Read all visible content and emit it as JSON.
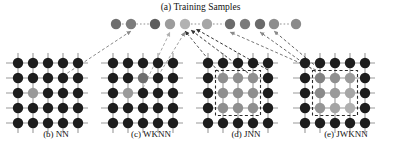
{
  "figure": {
    "title": "(a) Training Samples",
    "width": 401,
    "height": 148,
    "background": "#ffffff"
  },
  "colors": {
    "node_dark": "#1d1d1d",
    "node_gray_mid": "#8c8c8c",
    "node_gray_light": "#b4b4b4",
    "node_gray_lighter": "#c8c8c8",
    "grid_line": "#9a9a9a",
    "arrow_dark": "#222222",
    "arrow_gray": "#8a8a8a",
    "arrow_light": "#b0b0b0",
    "dashed_box": "#2a2a2a",
    "text": "#111111"
  },
  "training_samples": {
    "label": "(a) Training Samples",
    "row_y": 24,
    "radius": 5.2,
    "count": 11,
    "nodes": [
      {
        "index": 0,
        "x": 116,
        "y": 24,
        "shade": "#6f6f6f"
      },
      {
        "index": 1,
        "x": 131,
        "y": 24,
        "shade": "#7c7c7c"
      },
      {
        "index": 2,
        "x": 155,
        "y": 24,
        "shade": "#5e5e5e"
      },
      {
        "index": 3,
        "x": 170,
        "y": 24,
        "shade": "#9c9c9c"
      },
      {
        "index": 4,
        "x": 185,
        "y": 24,
        "shade": "#b2b2b2"
      },
      {
        "index": 5,
        "x": 207,
        "y": 24,
        "shade": "#a6a6a6"
      },
      {
        "index": 6,
        "x": 230,
        "y": 24,
        "shade": "#6b6b6b"
      },
      {
        "index": 7,
        "x": 245,
        "y": 24,
        "shade": "#7a7a7a"
      },
      {
        "index": 8,
        "x": 260,
        "y": 24,
        "shade": "#6a6a6a"
      },
      {
        "index": 9,
        "x": 274,
        "y": 24,
        "shade": "#8d8d8d"
      },
      {
        "index": 10,
        "x": 296,
        "y": 24,
        "shade": "#8a8a8a"
      }
    ]
  },
  "panels": [
    {
      "id": "nn",
      "label": "(b) NN",
      "caption_x": 10,
      "caption_width": 92,
      "origin_x": 18,
      "origin_y": 63,
      "cols": 5,
      "rows": 5,
      "spacing": 15,
      "radius": 5.2,
      "highlight": {
        "row": 2,
        "col": 1,
        "shade": "#9a9a9a"
      },
      "box": null,
      "description": "single nearest neighbour highlighted"
    },
    {
      "id": "wknn",
      "label": "(c) WKNN",
      "caption_x": 105,
      "caption_width": 92,
      "origin_x": 113,
      "origin_y": 63,
      "cols": 5,
      "rows": 5,
      "spacing": 15,
      "radius": 5.2,
      "highlight": {
        "row": 2,
        "col": 1,
        "shade": "#9a9a9a"
      },
      "secondary": {
        "row": 1,
        "col": 2,
        "shade": "#6e6e6e"
      },
      "box": null,
      "description": "weighted k nearest neighbours highlighted"
    },
    {
      "id": "jnn",
      "label": "(d) JNN",
      "caption_x": 200,
      "caption_width": 92,
      "origin_x": 208,
      "origin_y": 63,
      "cols": 5,
      "rows": 5,
      "spacing": 15,
      "radius": 5.2,
      "block": {
        "row_start": 1,
        "row_end": 3,
        "col_start": 1,
        "col_end": 3,
        "shade": "#8f8f8f"
      },
      "box": {
        "row_start": 1,
        "row_end": 3,
        "col_start": 1,
        "col_end": 3
      },
      "description": "joint 3x3 neighbourhood in dashed box, uniform shade"
    },
    {
      "id": "jwknn",
      "label": "(e) JWKNN",
      "caption_x": 298,
      "caption_width": 96,
      "origin_x": 305,
      "origin_y": 63,
      "cols": 5,
      "rows": 5,
      "spacing": 15,
      "radius": 5.2,
      "block": {
        "row_start": 1,
        "row_end": 3,
        "col_start": 1,
        "col_end": 3
      },
      "block_shades": [
        [
          "#828282",
          "#8f8f8f",
          "#9c9c9c"
        ],
        [
          "#8a8a8a",
          "#9a9a9a",
          "#a6a6a6"
        ],
        [
          "#959595",
          "#a4a4a4",
          "#b0b0b0"
        ]
      ],
      "box": {
        "row_start": 1,
        "row_end": 3,
        "col_start": 1,
        "col_end": 3
      },
      "description": "joint weighted 3x3 neighbourhood in dashed box, graded shades"
    }
  ],
  "arrows": [
    {
      "id": "nn-to-sample",
      "from": [
        63,
        76
      ],
      "to": [
        131,
        31
      ],
      "color": "#8a8a8a",
      "label": "NN highlighted node to training sample"
    },
    {
      "id": "wknn-to-a",
      "from": [
        143,
        88
      ],
      "to": [
        170,
        32
      ],
      "color": "#aaaaaa",
      "label": "WKNN node to training sample 3"
    },
    {
      "id": "wknn-to-b",
      "from": [
        158,
        76
      ],
      "to": [
        185,
        32
      ],
      "color": "#a0a0a0",
      "label": "WKNN node to training sample 4"
    },
    {
      "id": "jnn-to-a",
      "from": [
        222,
        76
      ],
      "to": [
        185,
        31
      ],
      "color": "#555555",
      "label": "JNN block to training sample 4"
    },
    {
      "id": "jnn-to-b",
      "from": [
        252,
        76
      ],
      "to": [
        191,
        30
      ],
      "color": "#3a3a3a",
      "label": "JNN block to training sample 4b"
    },
    {
      "id": "jnn-to-c",
      "from": [
        268,
        70
      ],
      "to": [
        196,
        29
      ],
      "color": "#333333",
      "label": "JNN block to training sample 5"
    },
    {
      "id": "jwknn-to-a",
      "from": [
        316,
        70
      ],
      "to": [
        230,
        32
      ],
      "color": "#777777",
      "label": "JWKNN block to training sample 7"
    },
    {
      "id": "jwknn-to-b",
      "from": [
        316,
        72
      ],
      "to": [
        260,
        32
      ],
      "color": "#6a6a6a",
      "label": "JWKNN block to training sample 9"
    },
    {
      "id": "jwknn-to-c",
      "from": [
        318,
        68
      ],
      "to": [
        274,
        31
      ],
      "color": "#666666",
      "label": "JWKNN block to training sample 10"
    }
  ],
  "sample_connectors": [
    {
      "id": "conn-0-1",
      "from": [
        122,
        24
      ],
      "to": [
        149,
        24
      ],
      "color": "#909090"
    },
    {
      "id": "conn-4-5",
      "from": [
        191,
        24
      ],
      "to": [
        201,
        24
      ],
      "color": "#909090"
    },
    {
      "id": "conn-5-6",
      "from": [
        213,
        24
      ],
      "to": [
        224,
        24
      ],
      "color": "#909090"
    },
    {
      "id": "conn-9-10",
      "from": [
        280,
        24
      ],
      "to": [
        290,
        24
      ],
      "color": "#909090"
    }
  ]
}
